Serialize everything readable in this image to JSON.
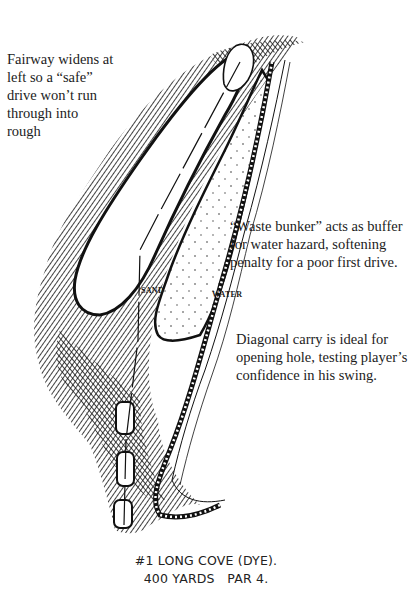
{
  "annotations": {
    "fairway_note": [
      "Fairway widens at",
      "left so a “safe”",
      "drive won’t run",
      "through into",
      "rough"
    ],
    "waste_bunker_note": [
      "“Waste bunker” acts as buffer",
      "for water hazard, softening",
      "penalty for a poor first drive."
    ],
    "diagonal_note": [
      "Diagonal carry is ideal for",
      "opening hole, testing player’s",
      "confidence in his swing."
    ]
  },
  "map_labels": {
    "sand": "SAND",
    "water": "WATER"
  },
  "caption": {
    "line1": "#1 LONG COVE (DYE).",
    "line2": "400 YARDS   PAR 4."
  },
  "colors": {
    "ink": "#111111",
    "paper": "#ffffff"
  }
}
